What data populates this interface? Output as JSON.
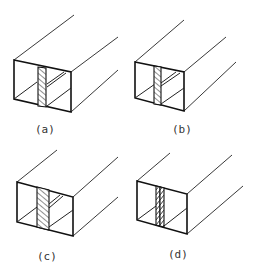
{
  "figure": {
    "type": "weld-joint-diagram",
    "panels": [
      {
        "id": "a",
        "label": "(a)",
        "weld_style": "diagonal-hatch-wide",
        "internal_plate": "angled-top-and-bottom-diagonal"
      },
      {
        "id": "b",
        "label": "(b)",
        "weld_style": "diagonal-hatch-wide",
        "internal_plate": "angled-top-and-bottom-diagonal"
      },
      {
        "id": "c",
        "label": "(c)",
        "weld_style": "diagonal-hatch-wide",
        "internal_plate": "angled-top-and-bottom-diagonal"
      },
      {
        "id": "d",
        "label": "(d)",
        "weld_style": "double-bead-narrow",
        "internal_plate": "bottom-diagonal-only"
      }
    ]
  },
  "colors": {
    "line": "#111111",
    "background": "#ffffff",
    "label": "#333333"
  }
}
